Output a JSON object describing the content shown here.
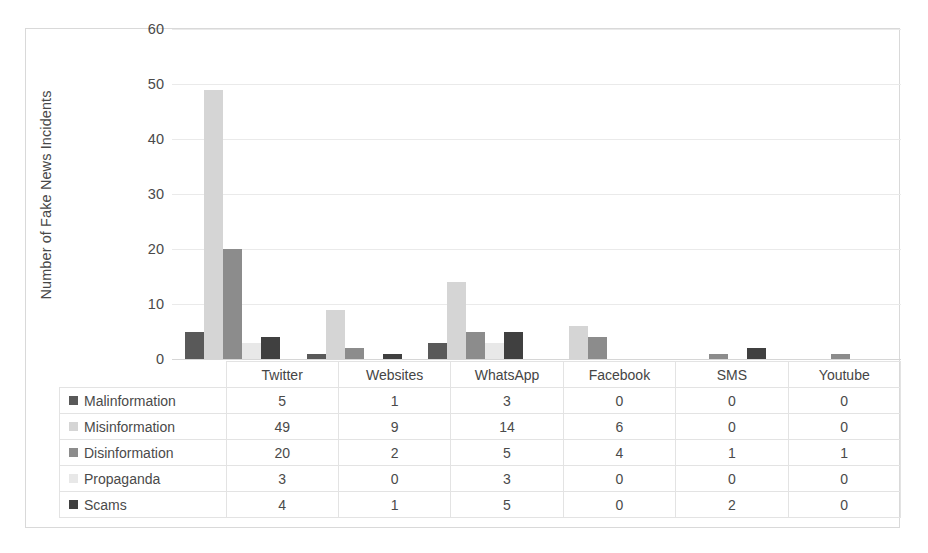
{
  "chart_data": {
    "type": "bar",
    "title": "",
    "subtitle": "",
    "xlabel": "",
    "ylabel": "Number of Fake News Incidents",
    "ylim": [
      0,
      60
    ],
    "ytick_values": [
      60,
      50,
      40,
      30,
      20,
      10,
      0
    ],
    "ytick_labels": [
      "60",
      "50",
      "40",
      "30",
      "20",
      "10",
      "0"
    ],
    "grid": true,
    "legend_position": "data-table-left",
    "categories": [
      "Twitter",
      "Websites",
      "WhatsApp",
      "Facebook",
      "SMS",
      "Youtube"
    ],
    "series": [
      {
        "name": "Malinformation",
        "color": "#595959",
        "values": [
          5,
          1,
          3,
          0,
          0,
          0
        ]
      },
      {
        "name": "Misinformation",
        "color": "#d5d5d5",
        "values": [
          49,
          9,
          14,
          6,
          0,
          0
        ]
      },
      {
        "name": "Disinformation",
        "color": "#8c8c8c",
        "values": [
          20,
          2,
          5,
          4,
          1,
          1
        ]
      },
      {
        "name": "Propaganda",
        "color": "#e8e8e8",
        "values": [
          3,
          0,
          3,
          0,
          0,
          0
        ]
      },
      {
        "name": "Scams",
        "color": "#404040",
        "values": [
          4,
          1,
          5,
          0,
          2,
          0
        ]
      }
    ],
    "table": {
      "header": [
        "",
        "Twitter",
        "Websites",
        "WhatsApp",
        "Facebook",
        "SMS",
        "Youtube"
      ],
      "rows": [
        {
          "label": "Malinformation",
          "values": [
            "5",
            "1",
            "3",
            "0",
            "0",
            "0"
          ]
        },
        {
          "label": "Misinformation",
          "values": [
            "49",
            "9",
            "14",
            "6",
            "0",
            "0"
          ]
        },
        {
          "label": "Disinformation",
          "values": [
            "20",
            "2",
            "5",
            "4",
            "1",
            "1"
          ]
        },
        {
          "label": "Propaganda",
          "values": [
            "3",
            "0",
            "3",
            "0",
            "0",
            "0"
          ]
        },
        {
          "label": "Scams",
          "values": [
            "4",
            "1",
            "5",
            "0",
            "2",
            "0"
          ]
        }
      ]
    },
    "colors": {
      "plot_background": "#ffffff",
      "gridline": "#eaeaea",
      "axis_line": "#d6d6d6",
      "frame_border": "#d9d9d9",
      "text": "#4a4a4a"
    }
  }
}
